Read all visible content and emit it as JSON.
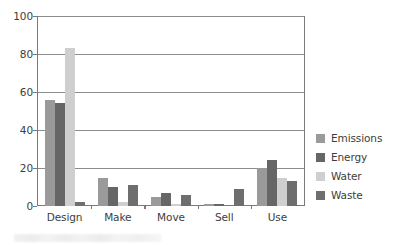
{
  "chart_data": {
    "type": "bar",
    "title": "",
    "subtitle": "",
    "xlabel": "",
    "ylabel": "",
    "ylim": [
      0,
      100
    ],
    "yticks": [
      0,
      20,
      40,
      60,
      80,
      100
    ],
    "grid": true,
    "legend_position": "right",
    "categories": [
      "Design",
      "Make",
      "Move",
      "Sell",
      "Use"
    ],
    "series": [
      {
        "name": "Emissions",
        "color": "#9a9a9a",
        "values": [
          56,
          15,
          5,
          1,
          20
        ]
      },
      {
        "name": "Energy",
        "color": "#666666",
        "values": [
          54,
          10,
          7,
          1,
          24
        ]
      },
      {
        "name": "Water",
        "color": "#cfcfcf",
        "values": [
          83,
          2,
          1,
          0,
          15
        ]
      },
      {
        "name": "Waste",
        "color": "#6e6e6e",
        "values": [
          2,
          11,
          6,
          9,
          13
        ]
      }
    ]
  },
  "axis": {
    "y_tick_labels": [
      "0",
      "20",
      "40",
      "60",
      "80",
      "100"
    ],
    "x_tick_labels": [
      "Design",
      "Make",
      "Move",
      "Sell",
      "Use"
    ]
  },
  "legend": {
    "items": [
      {
        "label": "Emissions",
        "color": "#9a9a9a"
      },
      {
        "label": "Energy",
        "color": "#666666"
      },
      {
        "label": "Water",
        "color": "#cfcfcf"
      },
      {
        "label": "Waste",
        "color": "#6e6e6e"
      }
    ]
  },
  "colors": {
    "axis": "#7a7a7a",
    "gridline": "#8c8c8c",
    "text": "#3d3d3d",
    "background": "#ffffff"
  }
}
